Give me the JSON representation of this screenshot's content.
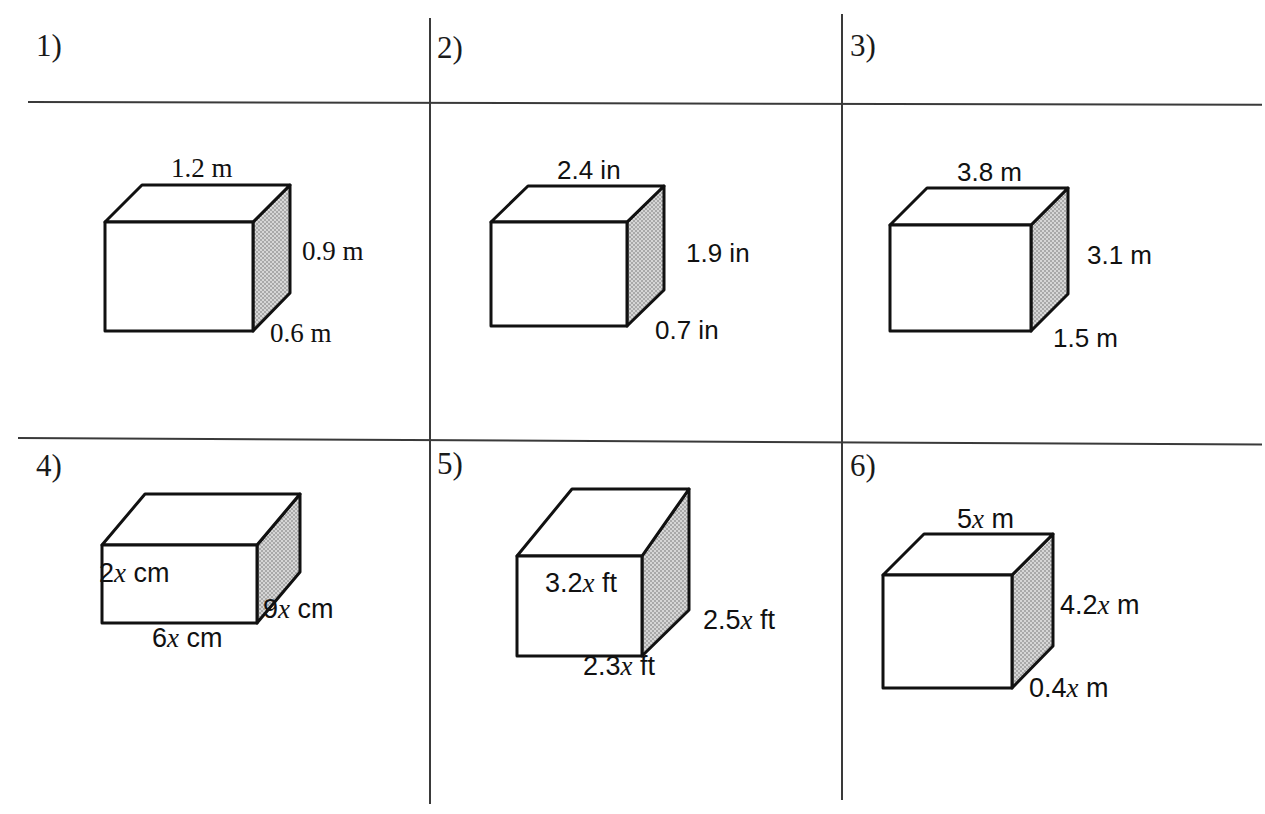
{
  "worksheet": {
    "type": "math-worksheet",
    "topic": "volume-surface-area-rectangular-prisms",
    "columns": 3,
    "rows": 2,
    "ink_color": "#111111",
    "shade_color": "#c0c0c0",
    "paper_color": "#ffffff"
  },
  "problems": [
    {
      "id": "p1",
      "number": "1)",
      "font": "serif",
      "shape": "rectangular-prism",
      "labels": {
        "top": "1.2 m",
        "right": "0.9 m",
        "depth": "0.6 m"
      },
      "dimensions": {
        "length": 1.2,
        "height": 0.9,
        "width": 0.6,
        "unit": "m"
      }
    },
    {
      "id": "p2",
      "number": "2)",
      "font": "sans",
      "shape": "rectangular-prism",
      "labels": {
        "top": "2.4 in",
        "right": "1.9 in",
        "depth": "0.7 in"
      },
      "dimensions": {
        "length": 2.4,
        "height": 1.9,
        "width": 0.7,
        "unit": "in"
      }
    },
    {
      "id": "p3",
      "number": "3)",
      "font": "sans",
      "shape": "rectangular-prism",
      "labels": {
        "top": "3.8 m",
        "right": "3.1 m",
        "depth": "1.5 m"
      },
      "dimensions": {
        "length": 3.8,
        "height": 3.1,
        "width": 1.5,
        "unit": "m"
      }
    },
    {
      "id": "p4",
      "number": "4)",
      "font": "sans",
      "shape": "rectangular-prism",
      "labels": {
        "height_front": {
          "coef": "2",
          "var": "x",
          "unit": " cm"
        },
        "bottom": {
          "coef": "6",
          "var": "x",
          "unit": " cm"
        },
        "depth": {
          "coef": "9",
          "var": "x",
          "unit": " cm"
        }
      },
      "dimensions": {
        "height": "2x",
        "length": "6x",
        "width": "9x",
        "unit": "cm"
      }
    },
    {
      "id": "p5",
      "number": "5)",
      "font": "sans",
      "shape": "rectangular-prism",
      "labels": {
        "height_front": {
          "coef": "3.2",
          "var": "x",
          "unit": " ft"
        },
        "bottom": {
          "coef": "2.3",
          "var": "x",
          "unit": " ft"
        },
        "depth": {
          "coef": "2.5",
          "var": "x",
          "unit": " ft"
        }
      },
      "dimensions": {
        "height": "3.2x",
        "length": "2.3x",
        "width": "2.5x",
        "unit": "ft"
      }
    },
    {
      "id": "p6",
      "number": "6)",
      "font": "sans",
      "shape": "rectangular-prism",
      "labels": {
        "top": {
          "coef": "5",
          "var": "x",
          "unit": " m"
        },
        "right": {
          "coef": "4.2",
          "var": "x",
          "unit": " m"
        },
        "depth": {
          "coef": "0.4",
          "var": "x",
          "unit": " m"
        }
      },
      "dimensions": {
        "length": "5x",
        "height": "4.2x",
        "width": "0.4x",
        "unit": "m"
      }
    }
  ]
}
